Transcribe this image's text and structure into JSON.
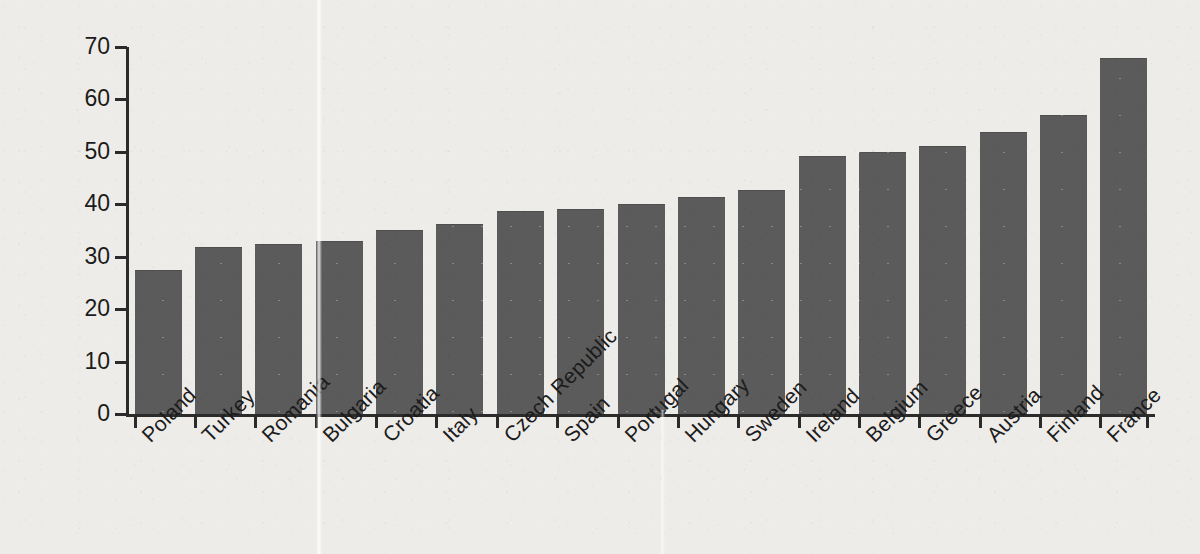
{
  "chart_data": {
    "type": "bar",
    "title": "",
    "subtitle": "",
    "xlabel": "",
    "ylabel": "respondents, %",
    "ylim": [
      0,
      70
    ],
    "yticks": [
      0,
      10,
      20,
      30,
      40,
      50,
      60,
      70
    ],
    "ytick_labels": [
      "0",
      "10",
      "20",
      "30",
      "40",
      "50",
      "60",
      "70"
    ],
    "grid": false,
    "legend": null,
    "bar_color": "#5b5b5b",
    "background_color": "#eeece9",
    "axis_color": "#2b2b2b",
    "text_color": "#1b1b1b",
    "categories": [
      "Poland",
      "Turkey",
      "Romania",
      "Bulgaria",
      "Croatia",
      "Italy",
      "Czech Republic",
      "Spain",
      "Portugal",
      "Hungary",
      "Sweden",
      "Ireland",
      "Belgium",
      "Greece",
      "Austria",
      "Finland",
      "France"
    ],
    "values": [
      27.3,
      31.6,
      32.2,
      32.8,
      35.0,
      36.1,
      38.6,
      38.9,
      39.8,
      41.2,
      42.5,
      49.1,
      49.8,
      51.0,
      53.6,
      56.8,
      67.8
    ]
  }
}
